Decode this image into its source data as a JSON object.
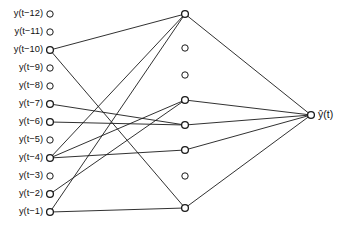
{
  "diagram": {
    "type": "neural-network-architecture",
    "width": 350,
    "height": 229,
    "background_color": "#ffffff",
    "stroke_color": "#1a1a1a"
  },
  "input_layer": {
    "name": "input-layer",
    "count": 12,
    "node_x": 50,
    "label_x": 43,
    "nodes": [
      {
        "id": "in1",
        "label": "y(t−12)",
        "y": 14,
        "connected": false
      },
      {
        "id": "in2",
        "label": "y(t−11)",
        "y": 32,
        "connected": false
      },
      {
        "id": "in3",
        "label": "y(t−10)",
        "y": 50,
        "connected": true
      },
      {
        "id": "in4",
        "label": "y(t−9)",
        "y": 68,
        "connected": false
      },
      {
        "id": "in5",
        "label": "y(t−8)",
        "y": 86,
        "connected": false
      },
      {
        "id": "in6",
        "label": "y(t−7)",
        "y": 104,
        "connected": true
      },
      {
        "id": "in7",
        "label": "y(t−6)",
        "y": 122,
        "connected": true
      },
      {
        "id": "in8",
        "label": "y(t−5)",
        "y": 140,
        "connected": false
      },
      {
        "id": "in9",
        "label": "y(t−4)",
        "y": 158,
        "connected": true
      },
      {
        "id": "in10",
        "label": "y(t−3)",
        "y": 176,
        "connected": false
      },
      {
        "id": "in11",
        "label": "y(t−2)",
        "y": 194,
        "connected": true
      },
      {
        "id": "in12",
        "label": "y(t−1)",
        "y": 212,
        "connected": true
      }
    ]
  },
  "hidden_layer": {
    "name": "hidden-layer",
    "count": 8,
    "node_x": 185,
    "nodes": [
      {
        "id": "h1",
        "y": 14,
        "connected": true
      },
      {
        "id": "h2",
        "y": 48,
        "connected": false
      },
      {
        "id": "h3",
        "y": 75,
        "connected": false
      },
      {
        "id": "h4",
        "y": 100,
        "connected": true
      },
      {
        "id": "h5",
        "y": 125,
        "connected": true
      },
      {
        "id": "h6",
        "y": 150,
        "connected": true
      },
      {
        "id": "h7",
        "y": 176,
        "connected": false
      },
      {
        "id": "h8",
        "y": 208,
        "connected": true
      }
    ]
  },
  "output_layer": {
    "name": "output-layer",
    "count": 1,
    "node_x": 311,
    "nodes": [
      {
        "id": "out1",
        "label": "ŷ(t)",
        "y": 115,
        "connected": true
      }
    ]
  },
  "edges": {
    "input_to_hidden": [
      {
        "from": "in3",
        "to": "h1"
      },
      {
        "from": "in3",
        "to": "h8"
      },
      {
        "from": "in6",
        "to": "h5"
      },
      {
        "from": "in7",
        "to": "h5"
      },
      {
        "from": "in9",
        "to": "h1"
      },
      {
        "from": "in9",
        "to": "h4"
      },
      {
        "from": "in9",
        "to": "h6"
      },
      {
        "from": "in11",
        "to": "h4"
      },
      {
        "from": "in12",
        "to": "h1"
      },
      {
        "from": "in12",
        "to": "h8"
      }
    ],
    "hidden_to_output": [
      {
        "from": "h1",
        "to": "out1"
      },
      {
        "from": "h4",
        "to": "out1"
      },
      {
        "from": "h5",
        "to": "out1"
      },
      {
        "from": "h6",
        "to": "out1"
      },
      {
        "from": "h8",
        "to": "out1"
      }
    ]
  },
  "style": {
    "node_radius": 3.2,
    "node_radius_active": 3.4,
    "edge_width": 0.9
  }
}
